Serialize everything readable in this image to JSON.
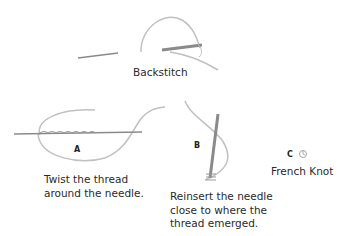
{
  "backstitch": {
    "label": "Backstitch"
  },
  "french_knot": {
    "steps": [
      {
        "letter": "A",
        "caption_lines": [
          "Twist the thread",
          "around the needle."
        ]
      },
      {
        "letter": "B",
        "caption_lines": [
          "Reinsert the needle",
          "close to where the",
          "thread emerged."
        ]
      },
      {
        "letter": "C",
        "caption_lines": []
      }
    ],
    "label": "French Knot"
  },
  "colors": {
    "thread": "#bdbdbd",
    "needle": "#8a8a8a",
    "text": "#2a2a2a"
  }
}
